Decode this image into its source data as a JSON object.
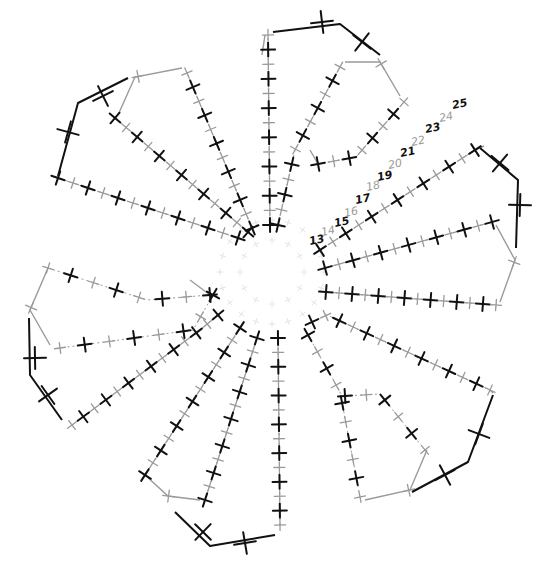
{
  "diagram": {
    "width": 540,
    "height": 568,
    "colors": {
      "black": "#111111",
      "grey": "#9a9a9a",
      "ghost": "#e4e4e4",
      "background": "#ffffff"
    },
    "center": [
      272,
      272
    ],
    "row_labels": [
      {
        "text": "13",
        "x": 310,
        "y": 245,
        "color": "black"
      },
      {
        "text": "14",
        "x": 322,
        "y": 236,
        "color": "grey"
      },
      {
        "text": "15",
        "x": 335,
        "y": 227,
        "color": "black"
      },
      {
        "text": "16",
        "x": 345,
        "y": 217,
        "color": "grey"
      },
      {
        "text": "17",
        "x": 356,
        "y": 204,
        "color": "black"
      },
      {
        "text": "18",
        "x": 367,
        "y": 191,
        "color": "grey"
      },
      {
        "text": "19",
        "x": 378,
        "y": 181,
        "color": "black"
      },
      {
        "text": "20",
        "x": 389,
        "y": 169,
        "color": "grey"
      },
      {
        "text": "21",
        "x": 401,
        "y": 157,
        "color": "black"
      },
      {
        "text": "22",
        "x": 412,
        "y": 146,
        "color": "grey"
      },
      {
        "text": "23",
        "x": 426,
        "y": 133,
        "color": "black"
      },
      {
        "text": "24",
        "x": 440,
        "y": 122,
        "color": "grey"
      },
      {
        "text": "25",
        "x": 453,
        "y": 109,
        "color": "black"
      }
    ],
    "spokes": [
      {
        "name": "top-left-outer",
        "points": [
          [
            238,
            238
          ],
          [
            58,
            178
          ]
        ],
        "stitches": 13
      },
      {
        "name": "top-left-inner",
        "points": [
          [
            248,
            232
          ],
          [
            115,
            118
          ]
        ],
        "stitches": 13
      },
      {
        "name": "top-upper-left",
        "points": [
          [
            252,
            228
          ],
          [
            187,
            73
          ]
        ],
        "stitches": 12
      },
      {
        "name": "top-vertical",
        "points": [
          [
            270,
            225
          ],
          [
            268,
            35
          ]
        ],
        "stitches": 14
      },
      {
        "name": "top-right-a",
        "points": [
          [
            278,
            225
          ],
          [
            295,
            150
          ],
          [
            340,
            67
          ]
        ],
        "stitches": 12
      },
      {
        "name": "top-right-b",
        "points": [
          [
            318,
            164
          ],
          [
            356,
            157
          ],
          [
            404,
            102
          ]
        ],
        "stitches": 8
      },
      {
        "name": "right-upper",
        "points": [
          [
            320,
            250
          ],
          [
            475,
            150
          ]
        ],
        "stitches": 13
      },
      {
        "name": "right-middle",
        "points": [
          [
            325,
            268
          ],
          [
            492,
            222
          ]
        ],
        "stitches": 13
      },
      {
        "name": "right-lower",
        "points": [
          [
            326,
            292
          ],
          [
            496,
            305
          ]
        ],
        "stitches": 14
      },
      {
        "name": "lower-right-outer",
        "points": [
          [
            312,
            322
          ],
          [
            327,
            315
          ],
          [
            490,
            390
          ]
        ],
        "stitches": 14
      },
      {
        "name": "lower-right-inner",
        "points": [
          [
            308,
            335
          ],
          [
            340,
            392
          ],
          [
            360,
            497
          ]
        ],
        "stitches": 10
      },
      {
        "name": "lower-right-loop",
        "points": [
          [
            345,
            396
          ],
          [
            380,
            394
          ],
          [
            425,
            450
          ]
        ],
        "stitches": 6
      },
      {
        "name": "bottom-vertical",
        "points": [
          [
            278,
            338
          ],
          [
            280,
            525
          ]
        ],
        "stitches": 14
      },
      {
        "name": "bottom-left-a",
        "points": [
          [
            257,
            338
          ],
          [
            205,
            500
          ]
        ],
        "stitches": 13
      },
      {
        "name": "bottom-left-b",
        "points": [
          [
            240,
            328
          ],
          [
            145,
            475
          ]
        ],
        "stitches": 13
      },
      {
        "name": "left-lower",
        "points": [
          [
            218,
            315
          ],
          [
            200,
            330
          ],
          [
            72,
            425
          ]
        ],
        "stitches": 14
      },
      {
        "name": "left-loop-lower",
        "points": [
          [
            213,
            295
          ],
          [
            193,
            330
          ],
          [
            60,
            348
          ]
        ],
        "stitches": 8
      },
      {
        "name": "left-loop-upper",
        "points": [
          [
            210,
            295
          ],
          [
            147,
            300
          ],
          [
            48,
            268
          ]
        ],
        "stitches": 8
      }
    ],
    "grey_edges": [
      {
        "points": [
          [
            118,
            115
          ],
          [
            135,
            77
          ],
          [
            182,
            68
          ]
        ]
      },
      {
        "points": [
          [
            265,
            35
          ],
          [
            262,
            55
          ]
        ]
      },
      {
        "points": [
          [
            345,
            62
          ],
          [
            380,
            62
          ],
          [
            400,
            96
          ]
        ]
      },
      {
        "points": [
          [
            318,
            164
          ],
          [
            310,
            150
          ]
        ]
      },
      {
        "points": [
          [
            475,
            150
          ],
          [
            484,
            146
          ]
        ]
      },
      {
        "points": [
          [
            496,
            225
          ],
          [
            515,
            260
          ],
          [
            500,
            302
          ]
        ]
      },
      {
        "points": [
          [
            490,
            390
          ],
          [
            493,
            393
          ]
        ]
      },
      {
        "points": [
          [
            427,
            450
          ],
          [
            410,
            490
          ],
          [
            365,
            500
          ]
        ]
      },
      {
        "points": [
          [
            145,
            475
          ],
          [
            168,
            496
          ],
          [
            200,
            500
          ]
        ]
      },
      {
        "points": [
          [
            48,
            268
          ],
          [
            30,
            310
          ],
          [
            50,
            345
          ]
        ]
      },
      {
        "points": [
          [
            210,
            295
          ],
          [
            190,
            280
          ]
        ]
      }
    ],
    "black_edges": [
      {
        "points": [
          [
            58,
            176
          ],
          [
            78,
            103
          ],
          [
            128,
            78
          ]
        ]
      },
      {
        "points": [
          [
            273,
            32
          ],
          [
            340,
            24
          ],
          [
            380,
            55
          ]
        ]
      },
      {
        "points": [
          [
            480,
            148
          ],
          [
            518,
            180
          ],
          [
            516,
            248
          ]
        ]
      },
      {
        "points": [
          [
            493,
            395
          ],
          [
            468,
            462
          ],
          [
            412,
            492
          ]
        ]
      },
      {
        "points": [
          [
            175,
            512
          ],
          [
            210,
            546
          ],
          [
            275,
            535
          ]
        ]
      },
      {
        "points": [
          [
            29,
            318
          ],
          [
            30,
            375
          ],
          [
            62,
            420
          ]
        ]
      }
    ],
    "black_edge_crosses": [
      [
        103,
        96
      ],
      [
        68,
        132
      ],
      [
        322,
        22
      ],
      [
        362,
        42
      ],
      [
        500,
        163
      ],
      [
        520,
        205
      ],
      [
        479,
        434
      ],
      [
        445,
        475
      ],
      [
        203,
        532
      ],
      [
        245,
        543
      ],
      [
        35,
        358
      ],
      [
        48,
        395
      ]
    ]
  }
}
